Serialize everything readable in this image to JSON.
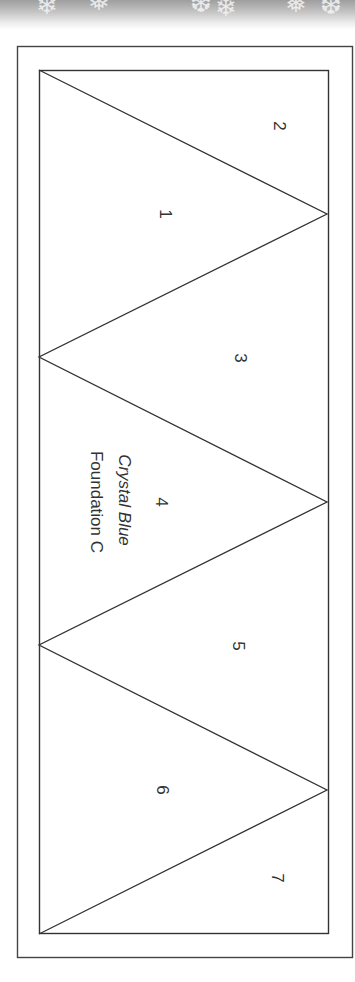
{
  "banner": {
    "icon": "snowflake-pattern"
  },
  "pattern": {
    "outer_frame": {
      "x": 17,
      "y": 46,
      "w": 336,
      "h": 912
    },
    "inner_frame": {
      "x": 39,
      "y": 70,
      "w": 290,
      "h": 864
    },
    "zigzag_points": [
      [
        39,
        70
      ],
      [
        327,
        214
      ],
      [
        39,
        357
      ],
      [
        327,
        502
      ],
      [
        39,
        645
      ],
      [
        327,
        790
      ],
      [
        39,
        934
      ]
    ],
    "stroke_color": "#333333"
  },
  "sections": [
    {
      "id": "1",
      "label": "1",
      "x": 165,
      "y": 214
    },
    {
      "id": "2",
      "label": "2",
      "x": 279,
      "y": 126
    },
    {
      "id": "3",
      "label": "3",
      "x": 240,
      "y": 358
    },
    {
      "id": "4",
      "label": "4",
      "x": 161,
      "y": 502
    },
    {
      "id": "5",
      "label": "5",
      "x": 238,
      "y": 646
    },
    {
      "id": "6",
      "label": "6",
      "x": 162,
      "y": 790
    },
    {
      "id": "7",
      "label": "7",
      "x": 277,
      "y": 878
    }
  ],
  "fabric": {
    "name": "Crystal Blue",
    "x": 124,
    "y": 500
  },
  "foundation": {
    "label": "Foundation C",
    "x": 96,
    "y": 502
  }
}
